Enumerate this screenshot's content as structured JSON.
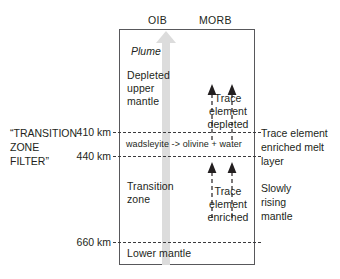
{
  "diagram": {
    "columns": {
      "oib": "OIB",
      "morb": "MORB"
    },
    "plume": {
      "label": "Plume",
      "color": "#dcdcdc"
    },
    "layers": [
      {
        "name": "depleted-upper-mantle",
        "label": "Depleted\nupper\nmantle"
      },
      {
        "name": "wadsleyite-band",
        "label": "wadsleyite -> olivine + water"
      },
      {
        "name": "transition-zone",
        "label": "Transition\nzone"
      },
      {
        "name": "lower-mantle",
        "label": "Lower mantle"
      }
    ],
    "depths": [
      {
        "value": "410 km",
        "y_label": "410"
      },
      {
        "value": "440 km",
        "y_label": "440"
      },
      {
        "value": "660 km",
        "y_label": "660"
      }
    ],
    "left_label": "“TRANSITION\nZONE\nFILTER”",
    "morb_annotations": [
      {
        "name": "trace-element-depleted",
        "label": "Trace\nelement\ndepleted"
      },
      {
        "name": "trace-element-enriched",
        "label": "Trace\nelement\nenriched"
      }
    ],
    "right_labels": [
      {
        "name": "enriched-melt-layer",
        "label": "Trace element\nenriched melt\nlayer"
      },
      {
        "name": "slowly-rising-mantle",
        "label": "Slowly\nrising\nmantle"
      }
    ],
    "colors": {
      "stroke": "#58585b",
      "text": "#231f20",
      "dashed": "#3a3a3c",
      "plume": "#dcdcdc"
    }
  }
}
